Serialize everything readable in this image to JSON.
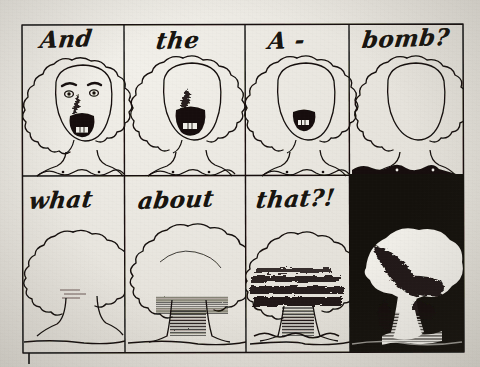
{
  "artwork": {
    "title": "And the A-bomb? what about that?!",
    "medium": "hand-drawn ink comic strip, photographed page",
    "layout": {
      "rows": 2,
      "columns": 4,
      "panel_count": 8
    },
    "paper_color": "#e9e6df",
    "ink_color": "#14110c"
  },
  "panels": [
    {
      "id": "panel-1",
      "row": 1,
      "column": 1,
      "caption": "And",
      "figure": "screaming-head-full-face",
      "face_features": "eyebrows, two eyes, nose, wide open mouth with teeth",
      "background": "paper"
    },
    {
      "id": "panel-2",
      "row": 1,
      "column": 2,
      "caption": "the",
      "figure": "screaming-head-no-eyes",
      "face_features": "nose, wide open mouth with teeth",
      "background": "paper"
    },
    {
      "id": "panel-3",
      "row": 1,
      "column": 3,
      "caption": "A -",
      "figure": "screaming-head-mouth-only",
      "face_features": "small open mouth with teeth",
      "background": "paper"
    },
    {
      "id": "panel-4",
      "row": 1,
      "column": 4,
      "caption": "bomb?",
      "figure": "blank-head-no-face",
      "face_features": "none",
      "background": "paper-with-black-chest"
    },
    {
      "id": "panel-5",
      "row": 2,
      "column": 1,
      "caption": "what",
      "figure": "plain-tree",
      "background": "paper"
    },
    {
      "id": "panel-6",
      "row": 2,
      "column": 2,
      "caption": "about",
      "figure": "tree-with-shaded-trunk",
      "background": "paper"
    },
    {
      "id": "panel-7",
      "row": 2,
      "column": 3,
      "caption": "that?!",
      "figure": "tree-becoming-mushroom-cloud",
      "background": "paper"
    },
    {
      "id": "panel-8",
      "row": 2,
      "column": 4,
      "caption": "",
      "figure": "nuclear-mushroom-cloud-explosion",
      "background": "black"
    }
  ],
  "captions": {
    "top_row": [
      "And",
      "the",
      "A -",
      "bomb?"
    ],
    "bottom_row": [
      "what",
      "about",
      "that?!",
      ""
    ]
  }
}
